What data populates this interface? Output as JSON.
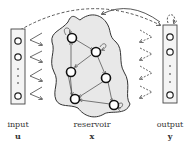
{
  "diagram": {
    "type": "echo-state-network",
    "colors": {
      "stroke": "#333333",
      "reservoir_fill": "#e8e8e8",
      "layer_fill": "#f4f4f4"
    },
    "layers": [
      {
        "id": "input",
        "label": "input",
        "symbol": "u"
      },
      {
        "id": "reservoir",
        "label": "reservoir",
        "symbol": "x"
      },
      {
        "id": "output",
        "label": "output",
        "symbol": "y"
      }
    ],
    "input_nodes": 4,
    "output_nodes": 4,
    "reservoir_nodes": 7
  }
}
